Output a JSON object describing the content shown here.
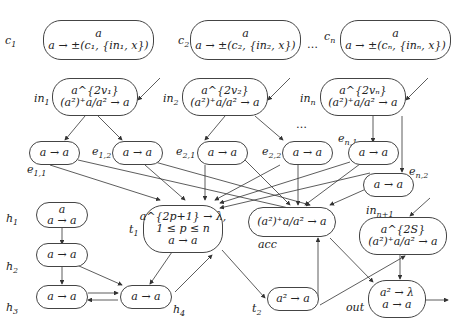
{
  "diagram": {
    "type": "spiking-neural-p-system",
    "nodes": {
      "c1": {
        "label": "c",
        "sub": "1",
        "line1": "a",
        "line2": "a → ±(c₁, {in₁, x})"
      },
      "c2": {
        "label": "c",
        "sub": "2",
        "line1": "a",
        "line2": "a → ±(c₂, {in₂, x})"
      },
      "cn": {
        "label": "c",
        "sub": "n",
        "line1": "a",
        "line2": "a → ±(cₙ, {inₙ, x})"
      },
      "in1": {
        "label": "in",
        "sub": "1",
        "line1": "a^{2v₁}",
        "line2": "(a²)⁺a/a² → a"
      },
      "in2": {
        "label": "in",
        "sub": "2",
        "line1": "a^{2v₂}",
        "line2": "(a²)⁺a/a² → a"
      },
      "inn": {
        "label": "in",
        "sub": "n",
        "line1": "a^{2vₙ}",
        "line2": "(a²)⁺a/a² → a"
      },
      "e11": {
        "label": "e",
        "sub": "1,1",
        "line1": "a → a"
      },
      "e12": {
        "label": "e",
        "sub": "1,2",
        "line1": "a → a"
      },
      "e21": {
        "label": "e",
        "sub": "2,1",
        "line1": "a → a"
      },
      "e22": {
        "label": "e",
        "sub": "2,2",
        "line1": "a → a"
      },
      "en1": {
        "label": "e",
        "sub": "n,1",
        "line1": "a → a"
      },
      "en2": {
        "label": "e",
        "sub": "n,2",
        "line1": "a → a"
      },
      "h1": {
        "label": "h",
        "sub": "1",
        "line1": "a",
        "line2": "a → a"
      },
      "h2": {
        "label": "h",
        "sub": "2",
        "line1": "a → a"
      },
      "h3": {
        "label": "h",
        "sub": "3",
        "line1": "a → a"
      },
      "h4": {
        "label": "h",
        "sub": "4",
        "line1": "a → a"
      },
      "t1": {
        "label": "t",
        "sub": "1",
        "line1": "a^{2p+1} → λ,",
        "line2": "1 ≤ p ≤ n",
        "line3": "a → a"
      },
      "acc": {
        "label": "acc",
        "line1": "(a²)⁺a/a² → a"
      },
      "t2": {
        "label": "t",
        "sub": "2",
        "line1": "a² → a"
      },
      "inn1": {
        "label": "in",
        "sub": "n+1",
        "line1": "a^{2S}",
        "line2": "(a²)⁺a/a² → a"
      },
      "out": {
        "label": "out",
        "line1": "a² → λ",
        "line2": "a → a"
      }
    },
    "ellipsis": "…"
  }
}
